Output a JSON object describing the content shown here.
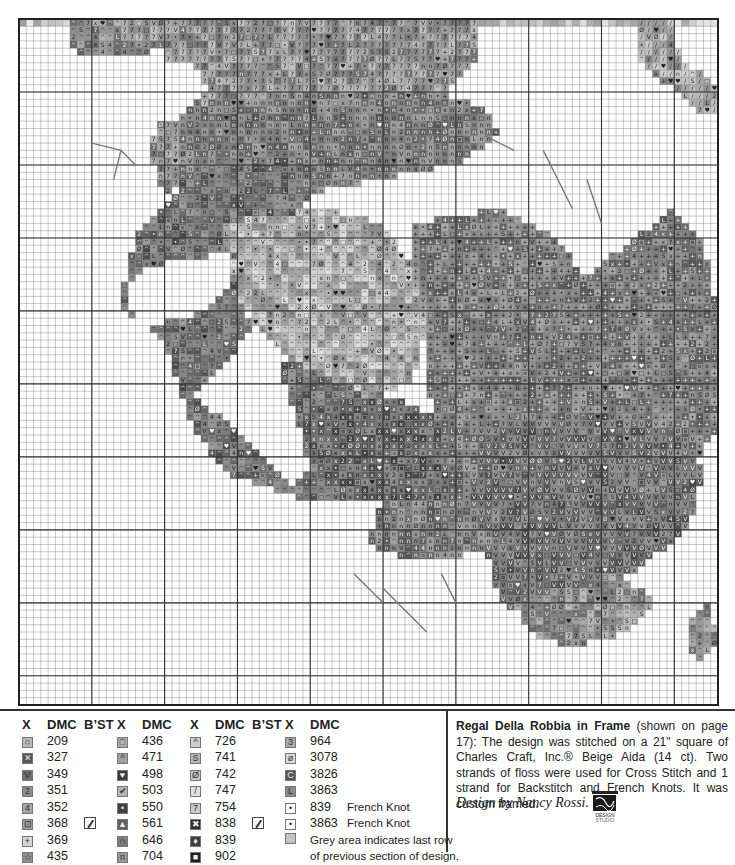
{
  "chart_data": {
    "type": "heatmap",
    "grid": {
      "cols": 96,
      "rows": 94,
      "major_every": 10
    },
    "fabric": "Beige Aida (14 ct)",
    "regions": [
      {
        "name": "top-left-leaves",
        "shade": 0.55,
        "symbol": "^",
        "poly": [
          [
            7,
            0
          ],
          [
            18,
            0
          ],
          [
            18,
            5
          ],
          [
            12,
            5
          ],
          [
            9,
            5
          ],
          [
            7,
            3
          ]
        ]
      },
      {
        "name": "top-band-fruit",
        "shade": 0.6,
        "symbol": "7",
        "poly": [
          [
            14,
            0
          ],
          [
            63,
            0
          ],
          [
            63,
            6
          ],
          [
            60,
            9
          ],
          [
            52,
            12
          ],
          [
            40,
            12
          ],
          [
            32,
            14
          ],
          [
            28,
            18
          ],
          [
            22,
            22
          ],
          [
            20,
            25
          ],
          [
            18,
            18
          ],
          [
            20,
            12
          ],
          [
            20,
            4
          ],
          [
            14,
            4
          ]
        ]
      },
      {
        "name": "upper-center-cluster",
        "shade": 0.5,
        "symbol": "n",
        "poly": [
          [
            22,
            12
          ],
          [
            40,
            10
          ],
          [
            58,
            10
          ],
          [
            64,
            12
          ],
          [
            66,
            16
          ],
          [
            60,
            20
          ],
          [
            50,
            22
          ],
          [
            40,
            24
          ],
          [
            34,
            26
          ],
          [
            26,
            26
          ],
          [
            22,
            22
          ]
        ]
      },
      {
        "name": "left-leaf-mass",
        "shade": 0.45,
        "symbol": "^",
        "poly": [
          [
            24,
            20
          ],
          [
            36,
            18
          ],
          [
            40,
            24
          ],
          [
            38,
            30
          ],
          [
            30,
            32
          ],
          [
            22,
            33
          ],
          [
            16,
            35
          ],
          [
            14,
            40
          ],
          [
            18,
            42
          ],
          [
            26,
            40
          ],
          [
            30,
            36
          ],
          [
            32,
            42
          ],
          [
            28,
            48
          ],
          [
            24,
            52
          ],
          [
            30,
            56
          ],
          [
            34,
            60
          ],
          [
            38,
            64
          ],
          [
            40,
            62
          ],
          [
            38,
            54
          ],
          [
            36,
            48
          ],
          [
            40,
            44
          ],
          [
            46,
            50
          ],
          [
            52,
            52
          ],
          [
            54,
            58
          ],
          [
            56,
            62
          ],
          [
            50,
            64
          ],
          [
            44,
            66
          ],
          [
            40,
            66
          ],
          [
            28,
            62
          ],
          [
            24,
            56
          ],
          [
            22,
            50
          ],
          [
            20,
            44
          ],
          [
            14,
            38
          ],
          [
            16,
            30
          ],
          [
            20,
            26
          ]
        ]
      },
      {
        "name": "center-leaf",
        "shade": 0.72,
        "symbol": "^",
        "poly": [
          [
            28,
            28
          ],
          [
            42,
            26
          ],
          [
            50,
            28
          ],
          [
            54,
            34
          ],
          [
            56,
            42
          ],
          [
            54,
            50
          ],
          [
            48,
            52
          ],
          [
            40,
            48
          ],
          [
            34,
            44
          ],
          [
            30,
            38
          ]
        ]
      },
      {
        "name": "center-fruit",
        "shade": 0.4,
        "symbol": "x",
        "poly": [
          [
            38,
            54
          ],
          [
            52,
            52
          ],
          [
            60,
            56
          ],
          [
            64,
            62
          ],
          [
            60,
            66
          ],
          [
            52,
            66
          ],
          [
            44,
            66
          ],
          [
            40,
            60
          ]
        ]
      },
      {
        "name": "right-fruit-cluster",
        "shade": 0.5,
        "symbol": "+",
        "poly": [
          [
            54,
            28
          ],
          [
            66,
            26
          ],
          [
            74,
            30
          ],
          [
            78,
            36
          ],
          [
            82,
            32
          ],
          [
            90,
            26
          ],
          [
            94,
            30
          ],
          [
            96,
            40
          ],
          [
            96,
            56
          ],
          [
            92,
            62
          ],
          [
            84,
            66
          ],
          [
            76,
            68
          ],
          [
            70,
            70
          ],
          [
            64,
            70
          ],
          [
            60,
            66
          ],
          [
            58,
            58
          ],
          [
            56,
            50
          ],
          [
            56,
            42
          ],
          [
            54,
            34
          ]
        ]
      },
      {
        "name": "lower-right-grapes",
        "shade": 0.45,
        "symbol": "V",
        "poly": [
          [
            64,
            56
          ],
          [
            80,
            54
          ],
          [
            90,
            56
          ],
          [
            94,
            62
          ],
          [
            92,
            70
          ],
          [
            84,
            76
          ],
          [
            76,
            80
          ],
          [
            70,
            82
          ],
          [
            66,
            80
          ],
          [
            64,
            72
          ],
          [
            62,
            66
          ]
        ]
      },
      {
        "name": "bottom-leaves",
        "shade": 0.58,
        "symbol": "^",
        "poly": [
          [
            68,
            80
          ],
          [
            82,
            76
          ],
          [
            88,
            80
          ],
          [
            84,
            84
          ],
          [
            76,
            86
          ],
          [
            70,
            84
          ]
        ]
      },
      {
        "name": "lower-left-grapes",
        "shade": 0.5,
        "symbol": "n",
        "poly": [
          [
            50,
            66
          ],
          [
            62,
            66
          ],
          [
            66,
            72
          ],
          [
            60,
            74
          ],
          [
            54,
            74
          ],
          [
            48,
            72
          ]
        ]
      },
      {
        "name": "top-right-frame",
        "shade": 0.65,
        "symbol": "/",
        "poly": [
          [
            85,
            0
          ],
          [
            90,
            0
          ],
          [
            90,
            3
          ],
          [
            91,
            5
          ],
          [
            93,
            7
          ],
          [
            96,
            9
          ],
          [
            96,
            13
          ],
          [
            93,
            13
          ],
          [
            92,
            11
          ],
          [
            89,
            9
          ],
          [
            87,
            7
          ],
          [
            85,
            5
          ]
        ]
      },
      {
        "name": "bottom-right-leaf",
        "shade": 0.58,
        "symbol": "^",
        "poly": [
          [
            92,
            82
          ],
          [
            95,
            80
          ],
          [
            96,
            86
          ],
          [
            94,
            88
          ],
          [
            92,
            86
          ]
        ]
      },
      {
        "name": "left-white-hole",
        "shade": 1.0,
        "symbol": "",
        "poly": [
          [
            18,
            6
          ],
          [
            24,
            6
          ],
          [
            26,
            10
          ],
          [
            22,
            14
          ],
          [
            18,
            14
          ]
        ]
      }
    ],
    "top_shade_row": {
      "shade": 0.8,
      "cols": [
        0,
        96
      ]
    },
    "stems": [
      [
        [
          10,
          17
        ],
        [
          14,
          18
        ],
        [
          16,
          20
        ]
      ],
      [
        [
          14,
          18
        ],
        [
          13,
          22
        ]
      ],
      [
        [
          72,
          18
        ],
        [
          74,
          22
        ],
        [
          76,
          26
        ]
      ],
      [
        [
          64,
          16
        ],
        [
          68,
          18
        ]
      ],
      [
        [
          78,
          22
        ],
        [
          80,
          28
        ]
      ],
      [
        [
          50,
          78
        ],
        [
          54,
          82
        ],
        [
          56,
          84
        ]
      ],
      [
        [
          58,
          76
        ],
        [
          60,
          80
        ]
      ],
      [
        [
          46,
          76
        ],
        [
          50,
          80
        ]
      ]
    ]
  },
  "legend": {
    "headers": {
      "x": "X",
      "dmc": "DMC",
      "bst": "B’ST"
    },
    "columns": [
      {
        "has_bst": true,
        "items": [
          {
            "symbol": "○",
            "dmc": "209",
            "color": "#b8b8b8",
            "bst": false
          },
          {
            "symbol": "✕",
            "dmc": "327",
            "color": "#555555",
            "bst": false
          },
          {
            "symbol": "V",
            "dmc": "349",
            "color": "#6f6f6f",
            "bst": false
          },
          {
            "symbol": "2",
            "dmc": "351",
            "color": "#8c8c8c",
            "bst": false
          },
          {
            "symbol": "4",
            "dmc": "352",
            "color": "#a6a6a6",
            "bst": false
          },
          {
            "symbol": "⊡",
            "dmc": "368",
            "color": "#9d9d9d",
            "bst": true
          },
          {
            "symbol": "+",
            "dmc": "369",
            "color": "#d4d4d4",
            "bst": false
          },
          {
            "symbol": "☆",
            "dmc": "435",
            "color": "#8e8e8e",
            "bst": false
          }
        ]
      },
      {
        "has_bst": false,
        "items": [
          {
            "symbol": "□",
            "dmc": "436",
            "color": "#b0b0b0"
          },
          {
            "symbol": "^",
            "dmc": "471",
            "color": "#a0a0a0"
          },
          {
            "symbol": "♥",
            "dmc": "498",
            "color": "#3a3a3a"
          },
          {
            "symbol": "✔",
            "dmc": "503",
            "color": "#b4b4b4"
          },
          {
            "symbol": "•",
            "dmc": "550",
            "color": "#404040"
          },
          {
            "symbol": "▲",
            "dmc": "561",
            "color": "#606060"
          },
          {
            "symbol": "∩",
            "dmc": "646",
            "color": "#7a7a7a"
          },
          {
            "symbol": "п",
            "dmc": "704",
            "color": "#9a9a9a"
          }
        ]
      },
      {
        "has_bst": true,
        "items": [
          {
            "symbol": "^",
            "dmc": "726",
            "color": "#cfcfcf",
            "bst": false
          },
          {
            "symbol": "S",
            "dmc": "741",
            "color": "#b8b8b8",
            "bst": false
          },
          {
            "symbol": "Ø",
            "dmc": "742",
            "color": "#c4c4c4",
            "bst": false
          },
          {
            "symbol": "/",
            "dmc": "747",
            "color": "#e0e0e0",
            "bst": false
          },
          {
            "symbol": "7",
            "dmc": "754",
            "color": "#c8c8c8",
            "bst": false
          },
          {
            "symbol": "✖",
            "dmc": "838",
            "color": "#2e2e2e",
            "bst": true
          },
          {
            "symbol": "♦",
            "dmc": "839",
            "color": "#3e3e3e",
            "bst": false
          },
          {
            "symbol": "■",
            "dmc": "902",
            "color": "#1e1e1e",
            "bst": false
          }
        ]
      },
      {
        "has_bst": false,
        "items": [
          {
            "symbol": "3",
            "dmc": "964",
            "color": "#aaaaaa",
            "note": ""
          },
          {
            "symbol": "ø",
            "dmc": "3078",
            "color": "#d8d8d8",
            "note": ""
          },
          {
            "symbol": "C",
            "dmc": "3826",
            "color": "#555555",
            "note": ""
          },
          {
            "symbol": "L",
            "dmc": "3863",
            "color": "#8a8a8a",
            "note": ""
          },
          {
            "symbol": "•",
            "dmc": "839",
            "color": "#ffffff",
            "note": "French Knot"
          },
          {
            "symbol": "•",
            "dmc": "3863",
            "color": "#ffffff",
            "note": "French Knot"
          },
          {
            "symbol": "",
            "dmc": "",
            "color": "#c4c4c4",
            "note": "Grey area indicates last row"
          },
          {
            "symbol": "",
            "dmc": "",
            "color": "",
            "note": "of previous section of design."
          }
        ]
      }
    ]
  },
  "notes": {
    "title": "Regal Della Robbia in Frame",
    "body": " (shown on page 17): The design was stitched on a 21\" square of Charles Craft, Inc.® Beige Aida (14 ct). Two strands of floss were used for Cross Stitch and 1 strand for Backstitch and French Knots. It was custom framed.",
    "byline": "Design by Nancy Rossi.",
    "logo_text": [
      "KOOLER",
      "DESIGN",
      "STUDIO"
    ]
  }
}
